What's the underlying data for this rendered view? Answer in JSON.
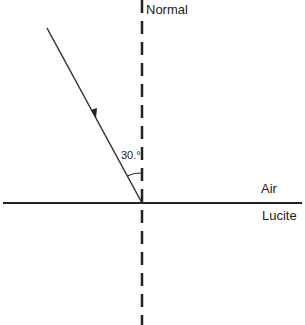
{
  "diagram": {
    "labels": {
      "normal": "Normal",
      "air": "Air",
      "lucite": "Lucite",
      "angle": "30.°"
    },
    "incident_angle_deg": 30,
    "media": {
      "top": "Air",
      "bottom": "Lucite"
    },
    "colors": {
      "line": "#222222",
      "background": "#ffffff"
    }
  }
}
